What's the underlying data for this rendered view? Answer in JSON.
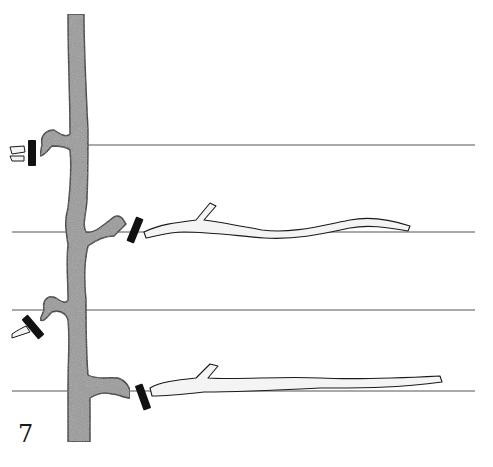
{
  "figure": {
    "label": "7"
  },
  "colors": {
    "background": "#ffffff",
    "trunk_fill": "#9a9a9a",
    "outline": "#1a1a1a",
    "wire": "#555555",
    "cane_fill": "#f4f4f4",
    "cut_mark": "#111111"
  },
  "wires": [
    {
      "name": "wire-1",
      "y": 145,
      "x1": 88,
      "x2": 475
    },
    {
      "name": "wire-2",
      "y": 232,
      "x1": 12,
      "x2": 475
    },
    {
      "name": "wire-3",
      "y": 310,
      "x1": 12,
      "x2": 475
    },
    {
      "name": "wire-4",
      "y": 391,
      "x1": 12,
      "x2": 475
    }
  ],
  "cut_marks": [
    {
      "name": "cut-mark-1",
      "x": 32,
      "y": 153,
      "angle": 0
    },
    {
      "name": "cut-mark-2",
      "x": 135,
      "y": 230,
      "angle": 20
    },
    {
      "name": "cut-mark-3",
      "x": 33,
      "y": 327,
      "angle": -40
    },
    {
      "name": "cut-mark-4",
      "x": 143,
      "y": 397,
      "angle": -20
    }
  ]
}
